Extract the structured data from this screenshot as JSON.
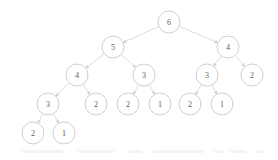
{
  "figure": {
    "background_color": "#ffffff",
    "node_fill": "#ffffff",
    "node_stroke": "#c9c9c9",
    "edge_color": "#d6d6d6",
    "label_color": "#5a5a5a",
    "node_radius": 11
  },
  "chart_data": {
    "type": "diagram",
    "diagram_kind": "tree",
    "directed": true,
    "edge_style": "straight-with-arrowhead",
    "nodes": [
      {
        "id": "n0",
        "label": "6",
        "x": 169,
        "y": 22,
        "depth": 0
      },
      {
        "id": "n1",
        "label": "5",
        "x": 113,
        "y": 47,
        "depth": 1
      },
      {
        "id": "n2",
        "label": "4",
        "x": 228,
        "y": 47,
        "depth": 1
      },
      {
        "id": "n3",
        "label": "4",
        "x": 77,
        "y": 75,
        "depth": 2
      },
      {
        "id": "n4",
        "label": "3",
        "x": 144,
        "y": 75,
        "depth": 2
      },
      {
        "id": "n5",
        "label": "3",
        "x": 207,
        "y": 75,
        "depth": 2
      },
      {
        "id": "n6",
        "label": "2",
        "x": 252,
        "y": 75,
        "depth": 2
      },
      {
        "id": "n7",
        "label": "3",
        "x": 48,
        "y": 104,
        "depth": 3
      },
      {
        "id": "n8",
        "label": "2",
        "x": 96,
        "y": 104,
        "depth": 3
      },
      {
        "id": "n9",
        "label": "2",
        "x": 128,
        "y": 104,
        "depth": 3
      },
      {
        "id": "n10",
        "label": "1",
        "x": 160,
        "y": 104,
        "depth": 3
      },
      {
        "id": "n11",
        "label": "2",
        "x": 190,
        "y": 104,
        "depth": 3
      },
      {
        "id": "n12",
        "label": "1",
        "x": 222,
        "y": 104,
        "depth": 3
      },
      {
        "id": "n13",
        "label": "2",
        "x": 33,
        "y": 133,
        "depth": 4
      },
      {
        "id": "n14",
        "label": "1",
        "x": 64,
        "y": 133,
        "depth": 4
      }
    ],
    "edges": [
      {
        "from": "n0",
        "to": "n1"
      },
      {
        "from": "n0",
        "to": "n2"
      },
      {
        "from": "n1",
        "to": "n3"
      },
      {
        "from": "n1",
        "to": "n4"
      },
      {
        "from": "n2",
        "to": "n5"
      },
      {
        "from": "n2",
        "to": "n6"
      },
      {
        "from": "n3",
        "to": "n7"
      },
      {
        "from": "n3",
        "to": "n8"
      },
      {
        "from": "n4",
        "to": "n9"
      },
      {
        "from": "n4",
        "to": "n10"
      },
      {
        "from": "n5",
        "to": "n11"
      },
      {
        "from": "n5",
        "to": "n12"
      },
      {
        "from": "n7",
        "to": "n13"
      },
      {
        "from": "n7",
        "to": "n14"
      }
    ]
  },
  "artifacts": {
    "ghost_blobs": [
      {
        "x": 22,
        "y": 150,
        "w": 42
      },
      {
        "x": 78,
        "y": 150,
        "w": 36
      },
      {
        "x": 128,
        "y": 150,
        "w": 14
      },
      {
        "x": 152,
        "y": 150,
        "w": 52
      },
      {
        "x": 214,
        "y": 150,
        "w": 10
      },
      {
        "x": 230,
        "y": 150,
        "w": 16
      },
      {
        "x": 256,
        "y": 150,
        "w": 8
      }
    ]
  }
}
